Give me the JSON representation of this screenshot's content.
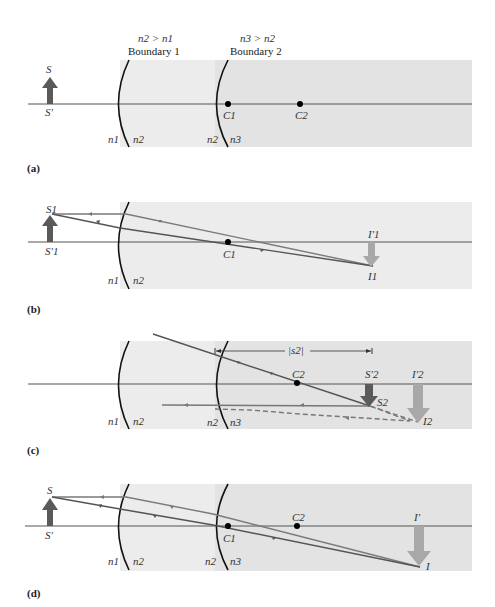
{
  "figure": {
    "panel_labels": [
      "(a)",
      "(b)",
      "(c)",
      "(d)"
    ],
    "conditions": {
      "boundary1": {
        "relation": "n2 > n1",
        "title": "Boundary 1"
      },
      "boundary2": {
        "relation": "n3 > n2",
        "title": "Boundary 2"
      }
    },
    "colors": {
      "medium2": "#ececec",
      "medium3": "#e3e3e3",
      "axis": "#555555",
      "boundary": "#111111",
      "object_arrow": "#5a5a5a",
      "image_arrow": "#a8a8a8",
      "ray_dark": "#555555",
      "ray_light": "#7a7a7a",
      "point": "#000000"
    },
    "panels": {
      "a": {
        "object": {
          "top": "S",
          "base": "S′"
        },
        "centers": [
          "C1",
          "C2"
        ],
        "media": [
          "n1",
          "n2",
          "n2",
          "n3"
        ]
      },
      "b": {
        "object": {
          "top": "S1",
          "base": "S′1"
        },
        "image": {
          "top": "I′1",
          "tip": "I1"
        },
        "centers": [
          "C1"
        ],
        "media": [
          "n1",
          "n2"
        ]
      },
      "c": {
        "object": {
          "top": "S′2",
          "tip": "S2"
        },
        "image": {
          "top": "I′2",
          "tip": "I2"
        },
        "distance_label": "|s2|",
        "centers": [
          "C2"
        ],
        "media": [
          "n1",
          "n2",
          "n2",
          "n3"
        ]
      },
      "d": {
        "object": {
          "top": "S",
          "base": "S′"
        },
        "image": {
          "top": "I′",
          "tip": "I"
        },
        "centers": [
          "C1",
          "C2"
        ],
        "media": [
          "n1",
          "n2",
          "n2",
          "n3"
        ]
      }
    }
  }
}
